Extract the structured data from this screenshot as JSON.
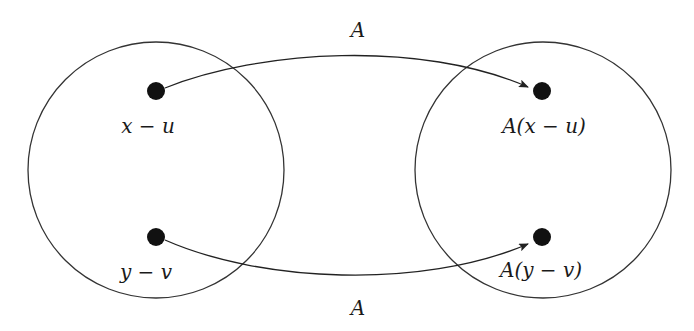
{
  "diagram": {
    "type": "mapping",
    "colors": {
      "stroke": "#333333",
      "dot": "#111111",
      "background": "#ffffff"
    },
    "domain_set": {
      "points": [
        {
          "label": "x − u"
        },
        {
          "label": "y − v"
        }
      ]
    },
    "codomain_set": {
      "points": [
        {
          "label": "A(x − u)"
        },
        {
          "label": "A(y − v)"
        }
      ]
    },
    "arrows": [
      {
        "from": "x − u",
        "to": "A(x − u)",
        "label": "A"
      },
      {
        "from": "y − v",
        "to": "A(y − v)",
        "label": "A"
      }
    ]
  }
}
